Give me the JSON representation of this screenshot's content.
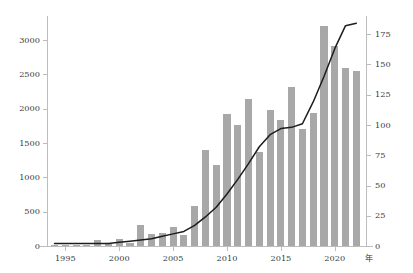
{
  "chart_data": {
    "type": "bar",
    "title": "",
    "subtitle": "",
    "xlabel": "年",
    "ylabel": "",
    "ylabel_right": "",
    "grid": false,
    "legend": "none",
    "x": [
      1994,
      1995,
      1996,
      1997,
      1998,
      1999,
      2000,
      2001,
      2002,
      2003,
      2004,
      2005,
      2006,
      2007,
      2008,
      2009,
      2010,
      2011,
      2012,
      2013,
      2014,
      2015,
      2016,
      2017,
      2018,
      2019,
      2020,
      2021,
      2022
    ],
    "categories": [
      "1994",
      "1995",
      "1996",
      "1997",
      "1998",
      "1999",
      "2000",
      "2001",
      "2002",
      "2003",
      "2004",
      "2005",
      "2006",
      "2007",
      "2008",
      "2009",
      "2010",
      "2011",
      "2012",
      "2013",
      "2014",
      "2015",
      "2016",
      "2017",
      "2018",
      "2019",
      "2020",
      "2021",
      "2022"
    ],
    "xlim": [
      1993.3,
      2022.9
    ],
    "xticks": [
      1995,
      2000,
      2005,
      2010,
      2015,
      2020
    ],
    "xticklabels": [
      "1995",
      "2000",
      "2005",
      "2010",
      "2015",
      "2020"
    ],
    "ylim": [
      0,
      3350
    ],
    "yticks": [
      0,
      500,
      1000,
      1500,
      2000,
      2500,
      3000
    ],
    "yticklabels": [
      "0",
      "500",
      "1000",
      "1500",
      "2000",
      "2500",
      "3000"
    ],
    "ylim_right": [
      0,
      190
    ],
    "yticks_right": [
      0,
      25,
      50,
      75,
      100,
      125,
      150,
      175
    ],
    "yticklabels_right": [
      "0",
      "25",
      "50",
      "75",
      "100",
      "125",
      "150",
      "175"
    ],
    "series": [
      {
        "name": "bars",
        "type": "bar",
        "color": "#a8a8a8",
        "axis": "left",
        "values": [
          10,
          12,
          15,
          20,
          85,
          25,
          100,
          40,
          300,
          175,
          190,
          280,
          165,
          590,
          1400,
          1185,
          1925,
          1760,
          2140,
          1370,
          1975,
          1840,
          2320,
          1705,
          1940,
          3200,
          2910,
          2600,
          2555
        ]
      },
      {
        "name": "line",
        "type": "line",
        "color": "#1c1c1c",
        "axis": "right",
        "values": [
          2,
          2,
          2,
          2,
          2,
          2,
          3,
          4,
          5,
          6,
          8,
          10,
          12,
          17,
          24,
          32,
          43,
          55,
          68,
          82,
          92,
          97,
          98,
          101,
          119,
          140,
          163,
          182,
          184
        ]
      }
    ]
  },
  "axes": {
    "x_axis_caption": "年"
  }
}
